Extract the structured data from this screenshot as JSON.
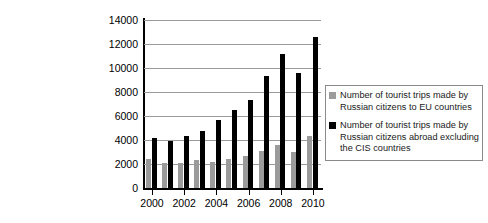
{
  "chart_data": {
    "type": "bar",
    "title": "",
    "xlabel": "",
    "ylabel": "",
    "grid": true,
    "legend_position": "right",
    "ylim": [
      0,
      14000
    ],
    "ytick_values": [
      0,
      2000,
      4000,
      6000,
      8000,
      10000,
      12000,
      14000
    ],
    "ytick_labels": [
      "0",
      "2000",
      "4000",
      "6000",
      "8000",
      "10000",
      "12000",
      "14000"
    ],
    "categories": [
      "2000",
      "2001",
      "2002",
      "2003",
      "2004",
      "2005",
      "2006",
      "2007",
      "2008",
      "2009",
      "2010"
    ],
    "xtick_labels": [
      "2000",
      "2002",
      "2004",
      "2006",
      "2008",
      "2010"
    ],
    "series": [
      {
        "name": "Number of tourist trips made by Russian citizens to EU countries",
        "color": "#9b9b9b",
        "values": [
          2400,
          2050,
          2050,
          2350,
          2200,
          2450,
          2650,
          3100,
          3600,
          3000,
          4300
        ]
      },
      {
        "name": "Number of tourist trips made by Russian citizens abroad excluding the CIS countries",
        "color": "#000000",
        "values": [
          4200,
          3950,
          4350,
          4750,
          5700,
          6500,
          7300,
          9300,
          11150,
          9600,
          12600
        ]
      }
    ]
  },
  "legend": {
    "items": [
      {
        "swatch": "eu",
        "label": "Number of tourist trips made by Russian citizens to EU countries"
      },
      {
        "swatch": "abroad",
        "label": "Number of tourist trips made by Russian citizens abroad excluding the CIS countries"
      }
    ]
  }
}
